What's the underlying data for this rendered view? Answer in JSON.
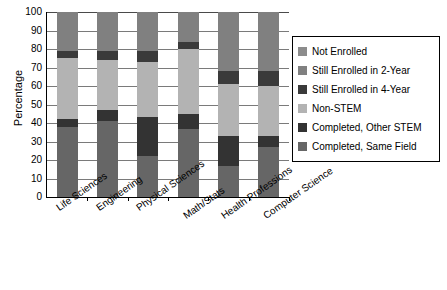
{
  "chart_data": {
    "type": "bar",
    "stacked": true,
    "title": "",
    "subtitle": "",
    "xlabel": "",
    "ylabel": "Percentage",
    "ylim": [
      0,
      100
    ],
    "ytick_labels": [
      "100",
      "90",
      "80",
      "70",
      "60",
      "50",
      "40",
      "30",
      "20",
      "10",
      "0"
    ],
    "ytick_values": [
      100,
      90,
      80,
      70,
      60,
      50,
      40,
      30,
      20,
      10,
      0
    ],
    "grid": true,
    "legend_position": "right",
    "categories": [
      "Life Sciences",
      "Engineering",
      "Physical Sciences",
      "Math/Stats",
      "Health Professions",
      "Computer Science"
    ],
    "series": [
      {
        "name": "Completed, Same Field",
        "color": "#666666",
        "values": [
          38,
          41,
          22,
          37,
          17,
          27
        ]
      },
      {
        "name": "Completed, Other STEM",
        "color": "#333333",
        "values": [
          4,
          6,
          21,
          8,
          16,
          6
        ]
      },
      {
        "name": "Non-STEM",
        "color": "#b3b3b3",
        "values": [
          33,
          27,
          30,
          35,
          28,
          27
        ]
      },
      {
        "name": "Still Enrolled in 4-Year",
        "color": "#3a3a3a",
        "values": [
          4,
          5,
          6,
          4,
          7,
          8
        ]
      },
      {
        "name": "Still Enrolled in 2-Year",
        "color": "#808080",
        "values": [
          21,
          21,
          21,
          16,
          32,
          32
        ]
      },
      {
        "name": "Not Enrolled",
        "color": "#8c8c8c",
        "values": [
          0,
          0,
          0,
          0,
          0,
          0
        ]
      }
    ]
  },
  "legend": {
    "items": [
      {
        "label": "Not Enrolled",
        "color": "#8c8c8c"
      },
      {
        "label": "Still Enrolled in 2-Year",
        "color": "#808080"
      },
      {
        "label": "Still Enrolled in 4-Year",
        "color": "#3a3a3a"
      },
      {
        "label": "Non-STEM",
        "color": "#b3b3b3"
      },
      {
        "label": "Completed, Other STEM",
        "color": "#333333"
      },
      {
        "label": "Completed, Same Field",
        "color": "#666666"
      }
    ]
  }
}
